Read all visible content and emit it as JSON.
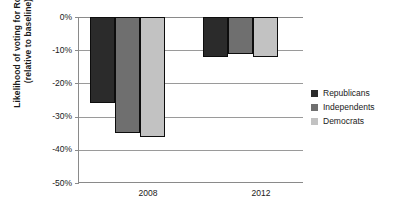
{
  "chart_data": {
    "type": "bar",
    "title": "",
    "xlabel": "",
    "ylabel_line1": "Likelihood of voting for Romney",
    "ylabel_line2": "(relative to baseline)",
    "categories": [
      "2008",
      "2012"
    ],
    "series": [
      {
        "name": "Republicans",
        "values": [
          -26,
          -12
        ],
        "color": "#2b2b2b"
      },
      {
        "name": "Independents",
        "values": [
          -35,
          -11
        ],
        "color": "#6f6f6f"
      },
      {
        "name": "Democrats",
        "values": [
          -36,
          -12
        ],
        "color": "#c2c2c2"
      }
    ],
    "ylim": [
      -50,
      0
    ],
    "ytick_labels": [
      "0%",
      "-10%",
      "-20%",
      "-30%",
      "-40%",
      "-50%"
    ],
    "ytick_values": [
      0,
      -10,
      -20,
      -30,
      -40,
      -50
    ],
    "grid": true,
    "legend_position": "right"
  },
  "legend": {
    "items": [
      {
        "label": "Republicans",
        "color": "#2b2b2b"
      },
      {
        "label": "Independents",
        "color": "#6f6f6f"
      },
      {
        "label": "Democrats",
        "color": "#c2c2c2"
      }
    ]
  },
  "axis": {
    "y_title_line1": "Likelihood of voting for Romney",
    "y_title_line2": "(relative to baseline)",
    "x_labels": [
      "2008",
      "2012"
    ],
    "y_labels": [
      "0%",
      "-10%",
      "-20%",
      "-30%",
      "-40%",
      "-50%"
    ]
  }
}
